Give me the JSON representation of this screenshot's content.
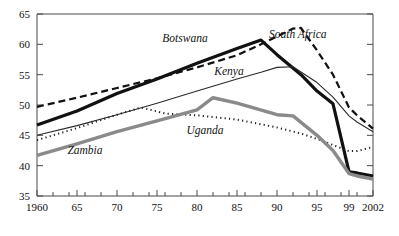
{
  "chart_data": {
    "type": "line",
    "title": "",
    "subtitle": "",
    "xlabel": "",
    "ylabel": "",
    "xlim": [
      1960,
      2002
    ],
    "ylim": [
      35,
      65
    ],
    "grid": false,
    "legend_position": "inline-labels",
    "x_tick_labels": [
      "1960",
      "65",
      "70",
      "75",
      "80",
      "85",
      "90",
      "95",
      "99",
      "2002"
    ],
    "x_tick_values": [
      1960,
      1965,
      1970,
      1975,
      1980,
      1985,
      1990,
      1995,
      1999,
      2002
    ],
    "x_minor_ticks": [
      1962,
      1964,
      1966,
      1968,
      1972,
      1974,
      1976,
      1978,
      1982,
      1984,
      1986,
      1988,
      1992,
      1994,
      1996,
      1998,
      2000
    ],
    "y_tick_labels": [
      "35",
      "40",
      "45",
      "50",
      "55",
      "60",
      "65"
    ],
    "y_tick_values": [
      35,
      40,
      45,
      50,
      55,
      60,
      65
    ],
    "series": [
      {
        "name": "South Africa",
        "label": "South Africa",
        "style": "dashed",
        "color": "#111111",
        "width": 2.2,
        "dash": "7,4",
        "label_x": 2000.0,
        "x": [
          1960,
          1965,
          1970,
          1975,
          1980,
          1985,
          1988,
          1990,
          1992,
          1993,
          1995,
          1997,
          1999,
          2000,
          2002
        ],
        "y": [
          49.7,
          51.2,
          52.8,
          54.4,
          56.2,
          58.2,
          60.0,
          61.3,
          62.6,
          62.7,
          59.0,
          55.0,
          49.6,
          48.3,
          46.1
        ]
      },
      {
        "name": "Botswana",
        "label": "Botswana",
        "style": "solid-thick",
        "color": "#111111",
        "width": 3.2,
        "dash": "",
        "x": [
          1960,
          1965,
          1970,
          1975,
          1980,
          1985,
          1988,
          1990,
          1993,
          1995,
          1997,
          1999,
          2000,
          2002
        ],
        "y": [
          46.7,
          49.0,
          51.9,
          54.3,
          56.9,
          59.3,
          60.7,
          58.3,
          55.0,
          52.3,
          50.2,
          39.0,
          38.8,
          38.3
        ]
      },
      {
        "name": "Kenya",
        "label": "Kenya",
        "style": "solid-thin",
        "color": "#2a2a2a",
        "width": 1.1,
        "dash": "",
        "x": [
          1960,
          1965,
          1970,
          1975,
          1980,
          1985,
          1988,
          1990,
          1992,
          1995,
          1997,
          1999,
          2000,
          2002
        ],
        "y": [
          45.0,
          46.6,
          48.4,
          50.3,
          52.3,
          54.3,
          55.4,
          56.2,
          56.3,
          53.7,
          51.3,
          48.2,
          47.2,
          45.6
        ]
      },
      {
        "name": "Uganda",
        "label": "Uganda",
        "style": "dotted",
        "color": "#222222",
        "width": 2.0,
        "dash": "1.2,3.2",
        "x": [
          1960,
          1965,
          1970,
          1973,
          1976,
          1980,
          1985,
          1990,
          1993,
          1995,
          1997,
          1999,
          2000,
          2002
        ],
        "y": [
          44.2,
          46.2,
          48.4,
          49.6,
          48.6,
          48.3,
          47.6,
          46.3,
          45.3,
          44.4,
          43.4,
          42.4,
          42.4,
          43.1
        ]
      },
      {
        "name": "Zambia",
        "label": "Zambia",
        "style": "solid-thick-gray",
        "color": "#8a8a8a",
        "width": 3.4,
        "dash": "",
        "x": [
          1960,
          1965,
          1970,
          1975,
          1980,
          1982,
          1985,
          1990,
          1992,
          1995,
          1997,
          1999,
          2000,
          2002
        ],
        "y": [
          41.7,
          43.6,
          45.6,
          47.4,
          49.2,
          51.2,
          50.3,
          48.4,
          48.2,
          45.0,
          42.5,
          38.7,
          38.3,
          37.8
        ]
      }
    ],
    "annotations": [
      {
        "text": "Botswana",
        "x": 1978.5,
        "y": 60.4
      },
      {
        "text": "South Africa",
        "x": 1992.6,
        "y": 61.0
      },
      {
        "text": "Kenya",
        "x": 1984.0,
        "y": 55.0
      },
      {
        "text": "Uganda",
        "x": 1981.0,
        "y": 45.2
      },
      {
        "text": "Zambia",
        "x": 1966.0,
        "y": 42.0
      }
    ]
  }
}
